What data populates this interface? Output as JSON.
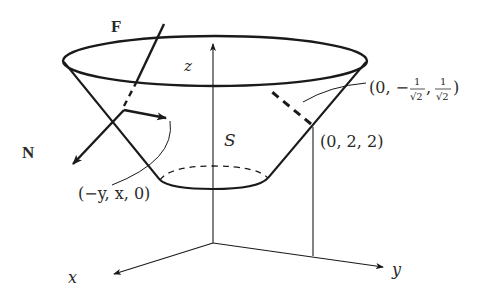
{
  "figure": {
    "labels": {
      "F": "F",
      "N": "N",
      "z": "z",
      "S": "S",
      "x": "x",
      "y": "y",
      "tangent_vector": "(−y, x, 0)",
      "point": "(0, 2, 2)",
      "normal_vector_prefix": "(0, −",
      "normal_vector_frac1_num": "1",
      "normal_vector_frac1_den": "√2",
      "normal_vector_mid": ",",
      "normal_vector_frac2_num": "1",
      "normal_vector_frac2_den": "√2",
      "normal_vector_suffix": ")"
    },
    "colors": {
      "stroke": "#1a1a1a",
      "text": "#2a2a2a",
      "background": "#ffffff"
    }
  }
}
